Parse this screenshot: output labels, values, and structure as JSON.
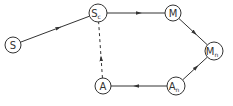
{
  "diagram": {
    "type": "directed-graph",
    "colors": {
      "stroke": "#333333",
      "background": "#ffffff"
    },
    "nodes": [
      {
        "id": "S",
        "label": "S",
        "sub": "",
        "x": 13,
        "y": 45,
        "r": 8
      },
      {
        "id": "Sc",
        "label": "S",
        "sub": "c",
        "x": 98,
        "y": 13,
        "r": 9
      },
      {
        "id": "M",
        "label": "M",
        "sub": "",
        "x": 173,
        "y": 13,
        "r": 8
      },
      {
        "id": "Mn",
        "label": "M",
        "sub": "n",
        "x": 214,
        "y": 51,
        "r": 9
      },
      {
        "id": "An",
        "label": "A",
        "sub": "n",
        "x": 176,
        "y": 86,
        "r": 9
      },
      {
        "id": "A",
        "label": "A",
        "sub": "",
        "x": 103,
        "y": 86,
        "r": 8
      }
    ],
    "edges": [
      {
        "from": "S",
        "to": "Sc",
        "style": "solid"
      },
      {
        "from": "Sc",
        "to": "M",
        "style": "solid"
      },
      {
        "from": "M",
        "to": "Mn",
        "style": "solid"
      },
      {
        "from": "An",
        "to": "Mn",
        "style": "solid"
      },
      {
        "from": "An",
        "to": "A",
        "style": "solid"
      },
      {
        "from": "A",
        "to": "Sc",
        "style": "dashed"
      }
    ]
  }
}
